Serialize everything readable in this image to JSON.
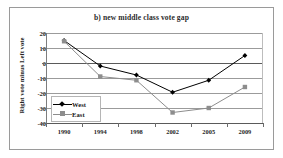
{
  "chart_data": {
    "type": "line",
    "title": "b) new middle class vote gap",
    "xlabel": "",
    "ylabel": "Right vote minus Left vote",
    "categories": [
      "1990",
      "1994",
      "1998",
      "2002",
      "2005",
      "2009"
    ],
    "series": [
      {
        "name": "West",
        "color": "#000000",
        "marker": "diamond",
        "values": [
          15,
          -2,
          -8,
          -19.5,
          -11.5,
          5
        ]
      },
      {
        "name": "East",
        "color": "#8d8d8d",
        "marker": "square",
        "values": [
          14.5,
          -9,
          -11.5,
          -33,
          -30,
          -16
        ]
      }
    ],
    "ylim": [
      -40,
      20
    ],
    "yticks": [
      20,
      10,
      0,
      -10,
      -20,
      -30,
      -40
    ],
    "ytick_labels": [
      "20",
      "10",
      "0",
      "-10",
      "-20",
      "-30",
      "-40"
    ],
    "grid": true,
    "legend_position": "inside-bottom-left"
  },
  "colors": {
    "west_series": "#000000",
    "east_series": "#8d8d8d",
    "gridline": "#9b9b9b",
    "axis": "#5a5a5a",
    "border": "#9a9a9a",
    "background": "#ffffff",
    "text": "#1f1f1f"
  }
}
